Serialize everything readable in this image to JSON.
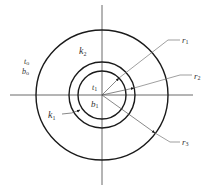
{
  "diagram": {
    "type": "concentric-circles-cross-section",
    "colors": {
      "line": "#1a1a1a",
      "axis": "#444444",
      "leader": "#777777",
      "text": "#333333",
      "background": "#ffffff"
    },
    "center": {
      "x": 102,
      "y": 95
    },
    "circles": [
      {
        "id": "inner",
        "r": 24
      },
      {
        "id": "middle",
        "r": 33
      },
      {
        "id": "outer",
        "rx": 66,
        "ry": 65
      }
    ],
    "labels": {
      "k2": {
        "main": "k",
        "sub": "2"
      },
      "k1": {
        "main": "k",
        "sub": "1"
      },
      "t0": {
        "main": "t",
        "sub": "o"
      },
      "b0": {
        "main": "b",
        "sub": "o"
      },
      "t1": {
        "main": "t",
        "sub": "1"
      },
      "b1": {
        "main": "b",
        "sub": "1"
      },
      "r1": {
        "main": "r",
        "sub": "1"
      },
      "r2": {
        "main": "r",
        "sub": "2"
      },
      "r3": {
        "main": "r",
        "sub": "3"
      }
    }
  }
}
